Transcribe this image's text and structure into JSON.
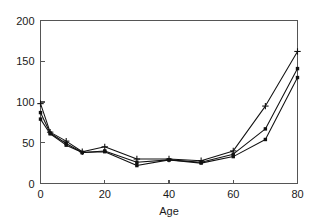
{
  "chart_data": {
    "type": "line",
    "title": "",
    "subtitle": "",
    "xlabel": "Age",
    "ylabel": "",
    "xlim": [
      0,
      80
    ],
    "ylim": [
      0,
      200
    ],
    "xticks": [
      0,
      20,
      40,
      60,
      80
    ],
    "yticks": [
      0,
      50,
      100,
      150,
      200
    ],
    "xtick_labels": [
      "0",
      "20",
      "40",
      "60",
      "80"
    ],
    "ytick_labels": [
      "0",
      "50",
      "100",
      "150",
      "200"
    ],
    "grid": false,
    "legend": null,
    "legend_position": "none",
    "x": [
      0,
      3,
      8,
      13,
      20,
      30,
      40,
      50,
      60,
      70,
      80
    ],
    "series": [
      {
        "name": "series-1",
        "marker": "plus",
        "color": "#111111",
        "values": [
          98,
          63,
          52,
          39,
          45,
          30,
          30,
          28,
          40,
          95,
          162
        ]
      },
      {
        "name": "series-2",
        "marker": "dot",
        "color": "#111111",
        "values": [
          87,
          62,
          49,
          38,
          40,
          26,
          29,
          26,
          36,
          67,
          141
        ]
      },
      {
        "name": "series-3",
        "marker": "dot",
        "color": "#111111",
        "values": [
          79,
          61,
          47,
          38,
          39,
          22,
          29,
          25,
          33,
          54,
          130
        ]
      }
    ]
  },
  "axis": {
    "xlabel": "Age",
    "xtick_labels": [
      "0",
      "20",
      "40",
      "60",
      "80"
    ],
    "ytick_labels": [
      "0",
      "50",
      "100",
      "150",
      "200"
    ]
  }
}
